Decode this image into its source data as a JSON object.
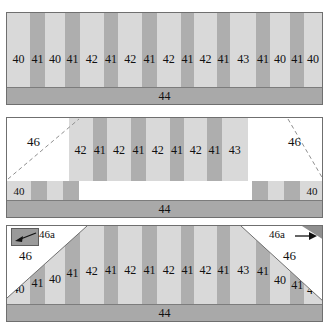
{
  "figure": {
    "caption_partial": "",
    "colors": {
      "light_layer": "#d9d9d9",
      "dark_layer": "#aeaeae",
      "substrate": "#a9a9a9",
      "outline": "#6f6f6f",
      "white_cut": "#ffffff",
      "dark_box": "#9a9a9a"
    }
  },
  "panels": [
    {
      "id": "panel-top",
      "name": "as-deposited-stack",
      "substrate_label": "44",
      "stripes": [
        {
          "label": "40",
          "type": "light"
        },
        {
          "label": "41",
          "type": "dark"
        },
        {
          "label": "40",
          "type": "light"
        },
        {
          "label": "41",
          "type": "dark"
        },
        {
          "label": "42",
          "type": "light"
        },
        {
          "label": "41",
          "type": "dark"
        },
        {
          "label": "42",
          "type": "light"
        },
        {
          "label": "41",
          "type": "dark"
        },
        {
          "label": "42",
          "type": "light"
        },
        {
          "label": "41",
          "type": "dark"
        },
        {
          "label": "42",
          "type": "light"
        },
        {
          "label": "41",
          "type": "dark"
        },
        {
          "label": "43",
          "type": "light"
        },
        {
          "label": "41",
          "type": "dark"
        },
        {
          "label": "40",
          "type": "light"
        },
        {
          "label": "41",
          "type": "dark"
        },
        {
          "label": "40",
          "type": "light"
        }
      ]
    },
    {
      "id": "panel-middle",
      "name": "edge-regions-removed",
      "substrate_label": "44",
      "cut_label_left": "46",
      "cut_label_right": "46",
      "stripes": [
        {
          "label": "42",
          "type": "light"
        },
        {
          "label": "41",
          "type": "dark"
        },
        {
          "label": "42",
          "type": "light"
        },
        {
          "label": "41",
          "type": "dark"
        },
        {
          "label": "42",
          "type": "light"
        },
        {
          "label": "41",
          "type": "dark"
        },
        {
          "label": "42",
          "type": "light"
        },
        {
          "label": "41",
          "type": "dark"
        },
        {
          "label": "43",
          "type": "light"
        }
      ],
      "left_stubs": [
        {
          "label": "40",
          "type": "light"
        },
        {
          "label": "",
          "type": "dark"
        },
        {
          "label": "",
          "type": "light"
        },
        {
          "label": "",
          "type": "dark"
        }
      ],
      "right_stubs": [
        {
          "label": "",
          "type": "dark"
        },
        {
          "label": "",
          "type": "light"
        },
        {
          "label": "",
          "type": "dark"
        },
        {
          "label": "40",
          "type": "light"
        }
      ]
    },
    {
      "id": "panel-bottom",
      "name": "tapered-edge-stack",
      "substrate_label": "44",
      "cut_label_left": "46",
      "cut_label_right": "46",
      "taper_label_left": "46a",
      "taper_label_right": "46a",
      "stripes": [
        {
          "label": "40",
          "type": "light"
        },
        {
          "label": "41",
          "type": "dark"
        },
        {
          "label": "40",
          "type": "light"
        },
        {
          "label": "41",
          "type": "dark"
        },
        {
          "label": "42",
          "type": "light"
        },
        {
          "label": "41",
          "type": "dark"
        },
        {
          "label": "42",
          "type": "light"
        },
        {
          "label": "41",
          "type": "dark"
        },
        {
          "label": "42",
          "type": "light"
        },
        {
          "label": "41",
          "type": "dark"
        },
        {
          "label": "42",
          "type": "light"
        },
        {
          "label": "41",
          "type": "dark"
        },
        {
          "label": "43",
          "type": "light"
        },
        {
          "label": "41",
          "type": "dark"
        },
        {
          "label": "40",
          "type": "light"
        },
        {
          "label": "41",
          "type": "dark"
        },
        {
          "label": "40",
          "type": "light"
        }
      ]
    }
  ]
}
